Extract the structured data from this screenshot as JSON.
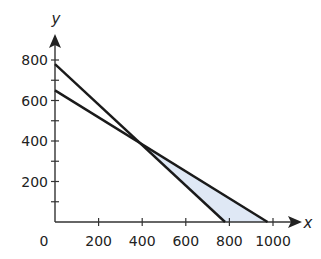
{
  "chart_data": {
    "type": "line",
    "title": "",
    "xlabel": "x",
    "ylabel": "y",
    "xlim": [
      0,
      1000
    ],
    "ylim": [
      0,
      800
    ],
    "x_ticks": [
      200,
      400,
      600,
      800,
      1000
    ],
    "x_tick_labels": [
      "0",
      "200",
      "400",
      "600",
      "800",
      "1000"
    ],
    "y_ticks": [
      100,
      200,
      300,
      400,
      500,
      600,
      700,
      800
    ],
    "y_tick_labels": [
      "200",
      "400",
      "600",
      "800"
    ],
    "grid": false,
    "legend": null,
    "series": [
      {
        "name": "line 1",
        "points": [
          [
            0,
            780
          ],
          [
            780,
            0
          ]
        ]
      },
      {
        "name": "line 2",
        "points": [
          [
            0,
            650
          ],
          [
            975,
            0
          ]
        ]
      }
    ],
    "shaded_region": {
      "description": "feasible region between the two lines right of intersection",
      "vertices": [
        [
          390,
          390
        ],
        [
          780,
          0
        ],
        [
          975,
          0
        ]
      ],
      "color": "#dfe8f5"
    }
  },
  "axes": {
    "x_label": "x",
    "y_label": "y",
    "origin_label": "0"
  }
}
